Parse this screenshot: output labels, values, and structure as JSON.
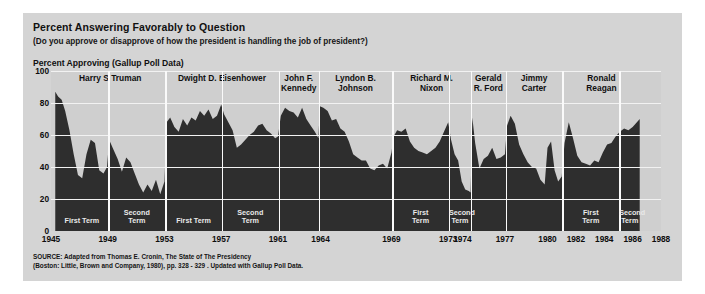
{
  "header": {
    "title": "Percent Answering Favorably to Question",
    "subtitle": "(Do you approve or disapprove of how the president is handling the job of president?)",
    "axis_caption": "Percent Approving (Gallup Poll Data)"
  },
  "source": {
    "line1": "SOURCE: Adapted from Thomas E. Cronin, The State of The Presidency",
    "line2": "(Boston: Little, Brown and Company, 1980), pp. 328 - 329 . Updated with Gallup Poll Data."
  },
  "colors": {
    "panel_background": "#d4d4d4",
    "plot_background": "#cfcfcf",
    "area_fill": "#2e2e2e",
    "gridline": "#f2f2f2",
    "separator": "#fafafa",
    "text": "#101010",
    "term_label_text": "#e9e9e9"
  },
  "presidents": [
    {
      "name": "Harry S Truman",
      "label": "Harry S Truman",
      "start": 1945.3,
      "end": 1953.05,
      "terms": [
        {
          "label": "First Term",
          "start": 1945.3,
          "end": 1949.05
        },
        {
          "label": "Second\nTerm",
          "start": 1949.05,
          "end": 1953.05
        }
      ]
    },
    {
      "name": "Dwight D. Eisenhower",
      "label": "Dwight D. Eisenhower",
      "start": 1953.05,
      "end": 1961.05,
      "terms": [
        {
          "label": "First Term",
          "start": 1953.05,
          "end": 1957.05
        },
        {
          "label": "Second\nTerm",
          "start": 1957.05,
          "end": 1961.05
        }
      ]
    },
    {
      "name": "John F. Kennedy",
      "label": "John F.\nKennedy",
      "start": 1961.05,
      "end": 1963.88,
      "terms": []
    },
    {
      "name": "Lyndon B. Johnson",
      "label": "Lyndon B.\nJohnson",
      "start": 1963.88,
      "end": 1969.05,
      "terms": []
    },
    {
      "name": "Richard M. Nixon",
      "label": "Richard M.\nNixon",
      "start": 1969.05,
      "end": 1974.6,
      "terms": [
        {
          "label": "First\nTerm",
          "start": 1969.05,
          "end": 1973.05
        },
        {
          "label": "Second\nTerm",
          "start": 1973.05,
          "end": 1974.6
        }
      ]
    },
    {
      "name": "Gerald R. Ford",
      "label": "Gerald\nR. Ford",
      "start": 1974.6,
      "end": 1977.05,
      "terms": []
    },
    {
      "name": "Jimmy Carter",
      "label": "Jimmy\nCarter",
      "start": 1977.05,
      "end": 1981.05,
      "terms": []
    },
    {
      "name": "Ronald Reagan",
      "label": "Ronald\nReagan",
      "start": 1981.05,
      "end": 1986.55,
      "terms": [
        {
          "label": "First\nTerm",
          "start": 1981.05,
          "end": 1985.05
        },
        {
          "label": "Second\nTerm",
          "start": 1985.05,
          "end": 1986.55
        }
      ]
    }
  ],
  "chart_data": {
    "type": "area",
    "title": "Percent Answering Favorably to Question",
    "subtitle": "(Do you approve or disapprove of how the president is handling the job of president?)",
    "xlabel": "",
    "ylabel": "Percent Approving (Gallup Poll Data)",
    "xlim": [
      1945,
      1988
    ],
    "ylim": [
      0,
      100
    ],
    "grid": true,
    "legend": "none",
    "yticks": [
      0,
      20,
      40,
      60,
      80,
      100
    ],
    "xticks": [
      1945,
      1949,
      1953,
      1957,
      1961,
      1964,
      1969,
      1973,
      1974,
      1977,
      1980,
      1982,
      1984,
      1986,
      1988
    ],
    "series": [
      {
        "name": "Presidential Approval",
        "x": [
          1945.3,
          1945.5,
          1945.75,
          1946.0,
          1946.3,
          1946.6,
          1946.9,
          1947.2,
          1947.5,
          1947.8,
          1948.1,
          1948.4,
          1948.7,
          1948.95,
          1949.1,
          1949.4,
          1949.7,
          1950.0,
          1950.3,
          1950.6,
          1950.9,
          1951.2,
          1951.5,
          1951.8,
          1952.1,
          1952.4,
          1952.7,
          1953.0,
          1953.15,
          1953.4,
          1953.7,
          1954.0,
          1954.3,
          1954.6,
          1954.9,
          1955.2,
          1955.5,
          1955.8,
          1956.1,
          1956.4,
          1956.7,
          1957.0,
          1957.2,
          1957.5,
          1957.8,
          1958.1,
          1958.4,
          1958.7,
          1959.0,
          1959.3,
          1959.6,
          1959.9,
          1960.2,
          1960.5,
          1960.8,
          1961.0,
          1961.2,
          1961.5,
          1961.8,
          1962.1,
          1962.4,
          1962.7,
          1963.0,
          1963.3,
          1963.6,
          1963.85,
          1963.95,
          1964.2,
          1964.5,
          1964.8,
          1965.1,
          1965.4,
          1965.7,
          1966.0,
          1966.3,
          1966.6,
          1966.9,
          1967.2,
          1967.5,
          1967.8,
          1968.1,
          1968.4,
          1968.7,
          1969.0,
          1969.15,
          1969.4,
          1969.7,
          1970.0,
          1970.3,
          1970.6,
          1970.9,
          1971.2,
          1971.5,
          1971.8,
          1972.1,
          1972.4,
          1972.7,
          1973.0,
          1973.2,
          1973.45,
          1973.7,
          1973.95,
          1974.2,
          1974.45,
          1974.58,
          1974.7,
          1974.9,
          1975.2,
          1975.5,
          1975.8,
          1976.1,
          1976.4,
          1976.7,
          1977.0,
          1977.15,
          1977.4,
          1977.7,
          1978.0,
          1978.3,
          1978.6,
          1978.9,
          1979.2,
          1979.5,
          1979.8,
          1980.0,
          1980.25,
          1980.5,
          1980.75,
          1981.0,
          1981.2,
          1981.5,
          1981.8,
          1982.1,
          1982.4,
          1982.7,
          1983.0,
          1983.3,
          1983.6,
          1983.9,
          1984.2,
          1984.5,
          1984.8,
          1985.1,
          1985.4,
          1985.7,
          1986.0,
          1986.3,
          1986.5
        ],
        "y": [
          87,
          84,
          82,
          75,
          63,
          48,
          35,
          33,
          48,
          57,
          55,
          38,
          36,
          40,
          57,
          51,
          45,
          37,
          46,
          43,
          36,
          29,
          24,
          29,
          25,
          32,
          23,
          31,
          68,
          71,
          65,
          62,
          70,
          66,
          71,
          69,
          75,
          72,
          76,
          70,
          72,
          79,
          73,
          68,
          63,
          52,
          54,
          57,
          60,
          62,
          66,
          67,
          63,
          61,
          58,
          59,
          72,
          77,
          75,
          74,
          71,
          77,
          70,
          66,
          62,
          58,
          78,
          77,
          75,
          69,
          70,
          64,
          62,
          56,
          48,
          46,
          44,
          44,
          39,
          38,
          41,
          42,
          39,
          49,
          59,
          63,
          62,
          64,
          56,
          52,
          50,
          49,
          48,
          50,
          52,
          56,
          62,
          68,
          57,
          48,
          44,
          31,
          26,
          25,
          24,
          71,
          55,
          39,
          45,
          47,
          52,
          45,
          46,
          48,
          66,
          72,
          67,
          54,
          48,
          43,
          40,
          39,
          32,
          29,
          52,
          56,
          38,
          31,
          34,
          55,
          68,
          58,
          47,
          43,
          42,
          41,
          44,
          43,
          49,
          54,
          55,
          59,
          62,
          64,
          63,
          65,
          68,
          70
        ]
      }
    ]
  }
}
